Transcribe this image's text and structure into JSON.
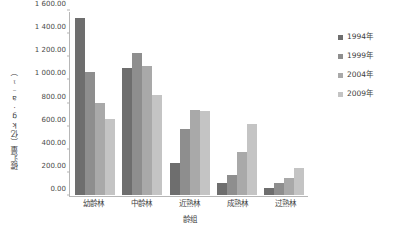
{
  "chart_data": {
    "type": "bar",
    "title": "",
    "subtitle": "",
    "xlabel": "龄组",
    "ylabel": "碳汇量（亿kg·a⁻¹）",
    "categories": [
      "幼龄林",
      "中龄林",
      "近熟林",
      "成熟林",
      "过熟林"
    ],
    "series": [
      {
        "name": "1994年",
        "color": "#6e6e6e",
        "values": [
          1530.0,
          1100.0,
          280.0,
          105.0,
          60.0
        ]
      },
      {
        "name": "1999年",
        "color": "#8e8e8e",
        "values": [
          1065.0,
          1230.0,
          575.0,
          175.0,
          100.0
        ]
      },
      {
        "name": "2004年",
        "color": "#a9a9a9",
        "values": [
          800.0,
          1115.0,
          735.0,
          370.0,
          150.0
        ]
      },
      {
        "name": "2009年",
        "color": "#c4c4c4",
        "values": [
          655.0,
          865.0,
          725.0,
          610.0,
          235.0
        ]
      }
    ],
    "ylim": [
      0,
      1600
    ],
    "ytick_step": 200,
    "ytick_labels": [
      "0.00",
      "200.00",
      "400.00",
      "600.00",
      "800.00",
      "1 000.00",
      "1 200.00",
      "1 400.00",
      "1 600.00"
    ],
    "grid": false,
    "legend_position": "right",
    "axis_color": "#b6b6b6",
    "text_color": "#3d3d3d",
    "background": "#ffffff"
  },
  "legend": {
    "items": [
      {
        "label": "1994年"
      },
      {
        "label": "1999年"
      },
      {
        "label": "2004年"
      },
      {
        "label": "2009年"
      }
    ]
  }
}
